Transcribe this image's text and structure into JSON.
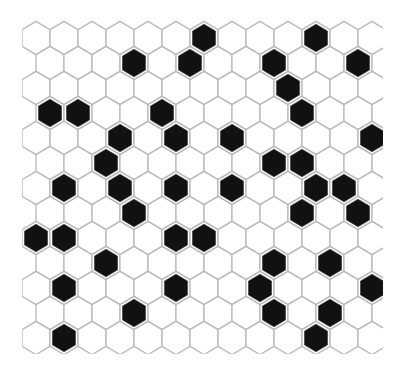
{
  "pattern": {
    "type": "hexagonal-tile-grid",
    "orientation": "pointy-top",
    "rows": 13,
    "cols_per_row": 13,
    "origin_x": 36,
    "origin_y": 38,
    "col_step": 28,
    "row_step": 25,
    "odd_row_offset": 14,
    "hex_width": 28,
    "hex_height": 33.3,
    "clip": {
      "x": 22,
      "y": 18,
      "width": 361,
      "height": 336
    },
    "colors": {
      "background": "#ffffff",
      "tile_fill": "#ffffff",
      "grout": "#b8b8b8",
      "black_tile": "#111111"
    },
    "black_cells": [
      {
        "row": 0,
        "cols": [
          6,
          10
        ]
      },
      {
        "row": 1,
        "cols": [
          3,
          5,
          8,
          11
        ]
      },
      {
        "row": 2,
        "cols": [
          9
        ]
      },
      {
        "row": 3,
        "cols": [
          0,
          1,
          4,
          9
        ]
      },
      {
        "row": 4,
        "cols": [
          3,
          5,
          7,
          12
        ]
      },
      {
        "row": 5,
        "cols": [
          2,
          8,
          9
        ]
      },
      {
        "row": 6,
        "cols": [
          1,
          3,
          5,
          7,
          10,
          11
        ]
      },
      {
        "row": 7,
        "cols": [
          3,
          9,
          11
        ]
      },
      {
        "row": 8,
        "cols": [
          0,
          1,
          5,
          6
        ]
      },
      {
        "row": 9,
        "cols": [
          2,
          8,
          10
        ]
      },
      {
        "row": 10,
        "cols": [
          1,
          5,
          8,
          12
        ]
      },
      {
        "row": 11,
        "cols": [
          3,
          8,
          10
        ]
      },
      {
        "row": 12,
        "cols": [
          1,
          10
        ]
      }
    ]
  }
}
